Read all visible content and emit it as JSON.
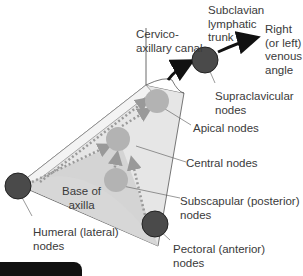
{
  "diagram": {
    "colors": {
      "node_dark": "#4a4a4a",
      "node_light": "#b3b3b3",
      "pyramid_fill": "#d9d9d9",
      "arrow": "#111111",
      "dotted_arrow": "#9a9a9a"
    },
    "labels": {
      "cervico_axillary_canal": "Cervico-\naxillary canal",
      "subclavian_trunk": "Subclavian\nlymphatic\ntrunk",
      "venous_angle": "Right\n(or left)\nvenous\nangle",
      "supraclavicular": "Supraclavicular\nnodes",
      "apical": "Apical nodes",
      "central": "Central nodes",
      "subscapular": "Subscapular (posterior)\nnodes",
      "pectoral": "Pectoral (anterior)\nnodes",
      "humeral": "Humeral (lateral)\nnodes",
      "base": "Base of\naxilla"
    }
  }
}
